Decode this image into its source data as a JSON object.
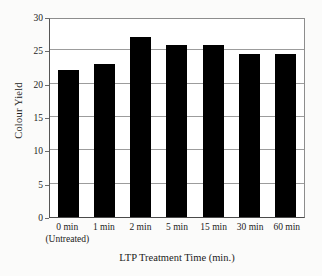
{
  "chart_data": {
    "type": "bar",
    "title": "",
    "xlabel": "LTP Treatment Time (min.)",
    "ylabel": "Colour Yield",
    "categories": [
      "0 min",
      "1 min",
      "2 min",
      "5 min",
      "15 min",
      "30 min",
      "60 min"
    ],
    "category_sublabels": [
      "(Untreated)",
      "",
      "",
      "",
      "",
      "",
      ""
    ],
    "values": [
      22.0,
      23.0,
      27.0,
      25.8,
      25.8,
      24.4,
      24.4
    ],
    "ylim": [
      0,
      30
    ],
    "yticks": [
      0,
      5,
      10,
      15,
      20,
      25,
      30
    ],
    "ytick_labels": [
      "0",
      "5",
      "10",
      "15",
      "20",
      "25",
      "30"
    ],
    "grid": true,
    "grid_axis": "y",
    "legend": false,
    "bar_color": "#000000",
    "plot_background": "#ffffff",
    "figure_background": "#fbfbfa"
  }
}
